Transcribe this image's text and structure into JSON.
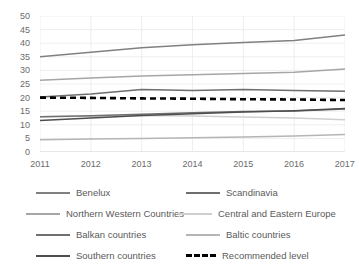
{
  "chart_data": {
    "type": "line",
    "title": "",
    "subtitle": "",
    "xlabel": "",
    "ylabel": "",
    "x": [
      2011,
      2012,
      2013,
      2014,
      2015,
      2016,
      2017
    ],
    "xtick_labels": [
      "2011",
      "2012",
      "2013",
      "2014",
      "2015",
      "2016",
      "2017"
    ],
    "ytick_labels": [
      "0",
      "5",
      "10",
      "15",
      "20",
      "25",
      "30",
      "35",
      "40",
      "45",
      "50"
    ],
    "yticks": [
      0,
      5,
      10,
      15,
      20,
      25,
      30,
      35,
      40,
      45,
      50
    ],
    "ylim": [
      0,
      50
    ],
    "xlim": [
      2011,
      2017
    ],
    "grid": true,
    "legend_position": "bottom",
    "series": [
      {
        "name": "Benelux",
        "color": "#808080",
        "style": "solid",
        "values": [
          35.0,
          36.7,
          38.3,
          39.4,
          40.3,
          41.0,
          43.0
        ]
      },
      {
        "name": "Scandinavia",
        "color": "#6e6e6e",
        "style": "solid",
        "values": [
          20.2,
          21.3,
          23.0,
          22.6,
          23.0,
          22.6,
          22.3
        ]
      },
      {
        "name": "Northern Western Countries",
        "color": "#a6a6a6",
        "style": "solid",
        "values": [
          26.4,
          27.2,
          27.9,
          28.4,
          28.9,
          29.3,
          30.5
        ]
      },
      {
        "name": "Central and Eastern Europe",
        "color": "#cfcfcf",
        "style": "solid",
        "values": [
          13.0,
          13.1,
          13.4,
          13.2,
          12.9,
          12.5,
          11.9
        ]
      },
      {
        "name": "Balkan countries",
        "color": "#707070",
        "style": "solid",
        "values": [
          13.0,
          13.3,
          13.9,
          14.4,
          14.9,
          15.1,
          15.8
        ]
      },
      {
        "name": "Baltic countries",
        "color": "#b5b5b5",
        "style": "solid",
        "values": [
          4.5,
          4.8,
          5.0,
          5.2,
          5.5,
          5.9,
          6.4
        ]
      },
      {
        "name": "Southern countries",
        "color": "#4d4d4d",
        "style": "solid",
        "values": [
          11.6,
          12.5,
          13.4,
          14.1,
          14.7,
          15.2,
          16.0
        ]
      },
      {
        "name": "Recommended level",
        "color": "#000000",
        "style": "dashed",
        "values": [
          20.0,
          19.9,
          19.7,
          19.6,
          19.4,
          19.3,
          19.1
        ]
      }
    ]
  },
  "legend": {
    "rows": [
      {
        "left": "Benelux",
        "right": "Scandinavia"
      },
      {
        "left": "Northern Western Countries",
        "right": "Central and Eastern Europe"
      },
      {
        "left": "Balkan countries",
        "right": "Baltic countries"
      },
      {
        "left": "Southern countries",
        "right": "Recommended level"
      }
    ]
  }
}
